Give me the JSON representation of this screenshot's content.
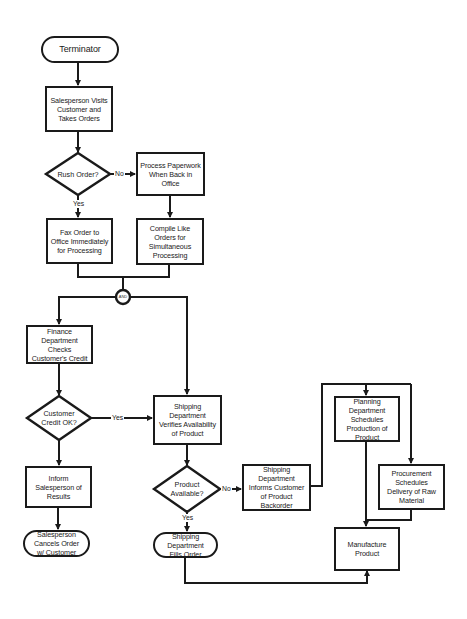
{
  "diagram": {
    "type": "flowchart",
    "nodes": {
      "start": {
        "shape": "terminator",
        "label": "Terminator"
      },
      "visit": {
        "shape": "process",
        "label": "Salesperson Visits Customer and Takes Orders"
      },
      "rush": {
        "shape": "decision",
        "label": "Rush Order?"
      },
      "process_paperwork": {
        "shape": "process",
        "label": "Process Paperwork When Back in Office"
      },
      "fax": {
        "shape": "process",
        "label": "Fax Order to Office Immediately for Processing"
      },
      "compile": {
        "shape": "process",
        "label": "Compile Like Orders for Simultaneous Processing"
      },
      "and_connector": {
        "shape": "connector",
        "label": "AND"
      },
      "finance": {
        "shape": "process",
        "label": "Finance Department Checks Customer's Credit"
      },
      "credit_ok": {
        "shape": "decision",
        "label": "Customer Credit OK?"
      },
      "inform": {
        "shape": "process",
        "label": "Inform Salesperson of Results"
      },
      "cancel": {
        "shape": "terminator",
        "label": "Salesperson Cancels Order w/ Customer"
      },
      "verify": {
        "shape": "process",
        "label": "Shipping Department Verifies Availability of Product"
      },
      "available": {
        "shape": "decision",
        "label": "Product Available?"
      },
      "fills": {
        "shape": "terminator",
        "label": "Shipping Department Fills Order"
      },
      "backorder": {
        "shape": "process",
        "label": "Shipping Department Informs Customer of Product Backorder"
      },
      "planning": {
        "shape": "process",
        "label": "Planning Department Schedules Production of Product"
      },
      "procurement": {
        "shape": "process",
        "label": "Procurement Schedules Delivery of Raw Material"
      },
      "manufacture": {
        "shape": "process",
        "label": "Manufacture Product"
      }
    },
    "edge_labels": {
      "rush_no": "No",
      "rush_yes": "Yes",
      "credit_yes": "Yes",
      "available_no": "No",
      "available_yes": "Yes"
    },
    "edges": [
      {
        "from": "start",
        "to": "visit"
      },
      {
        "from": "visit",
        "to": "rush"
      },
      {
        "from": "rush",
        "to": "process_paperwork",
        "label": "No"
      },
      {
        "from": "rush",
        "to": "fax",
        "label": "Yes"
      },
      {
        "from": "process_paperwork",
        "to": "compile"
      },
      {
        "from": "fax",
        "to": "and_connector"
      },
      {
        "from": "compile",
        "to": "and_connector"
      },
      {
        "from": "and_connector",
        "to": "finance"
      },
      {
        "from": "and_connector",
        "to": "verify"
      },
      {
        "from": "finance",
        "to": "credit_ok"
      },
      {
        "from": "credit_ok",
        "to": "verify",
        "label": "Yes"
      },
      {
        "from": "credit_ok",
        "to": "inform"
      },
      {
        "from": "inform",
        "to": "cancel"
      },
      {
        "from": "verify",
        "to": "available"
      },
      {
        "from": "available",
        "to": "backorder",
        "label": "No"
      },
      {
        "from": "available",
        "to": "fills",
        "label": "Yes"
      },
      {
        "from": "backorder",
        "to": "planning"
      },
      {
        "from": "backorder",
        "to": "procurement"
      },
      {
        "from": "planning",
        "to": "manufacture"
      },
      {
        "from": "procurement",
        "to": "manufacture"
      },
      {
        "from": "fills",
        "to": "manufacture"
      }
    ],
    "colors": {
      "stroke": "#1a1a1a",
      "background": "#ffffff"
    }
  }
}
